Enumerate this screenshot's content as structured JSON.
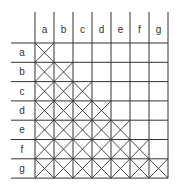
{
  "diagram": {
    "column_labels": [
      "a",
      "b",
      "c",
      "d",
      "e",
      "f",
      "g"
    ],
    "row_labels": [
      "a",
      "b",
      "c",
      "d",
      "e",
      "f",
      "g"
    ],
    "line_color": "#333333"
  }
}
